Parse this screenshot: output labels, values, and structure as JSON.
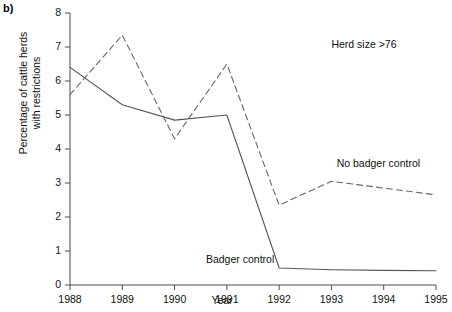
{
  "panel": {
    "label": "b)"
  },
  "chart_data": {
    "type": "line",
    "title": "",
    "xlabel": "Year",
    "ylabel": "Percentage of cattle herds\nwith restrictions",
    "categories": [
      "1988",
      "1989",
      "1990",
      "1991",
      "1992",
      "1993",
      "1994",
      "1995"
    ],
    "x": [
      1988,
      1989,
      1990,
      1991,
      1992,
      1993,
      1994,
      1995
    ],
    "xlim": [
      1988,
      1995
    ],
    "ylim": [
      0,
      8
    ],
    "yticks": [
      "0",
      "1",
      "2",
      "3",
      "4",
      "5",
      "6",
      "7",
      "8"
    ],
    "grid": false,
    "legend_position": "inline-annotations",
    "series": [
      {
        "name": "Badger control",
        "style": "solid",
        "color": "#555555",
        "values": [
          6.4,
          5.3,
          4.85,
          5.0,
          0.5,
          0.45,
          0.43,
          0.42
        ]
      },
      {
        "name": "No badger control",
        "style": "dashed",
        "color": "#666666",
        "values": [
          5.6,
          7.35,
          4.3,
          6.5,
          2.35,
          3.05,
          2.85,
          2.65
        ]
      }
    ],
    "annotations": [
      {
        "text": "Herd size >76",
        "x": 1993.0,
        "y": 7.05
      },
      {
        "text": "No badger control",
        "x": 1993.1,
        "y": 3.55
      },
      {
        "text": "Badger control",
        "x": 1990.6,
        "y": 0.75
      }
    ]
  }
}
